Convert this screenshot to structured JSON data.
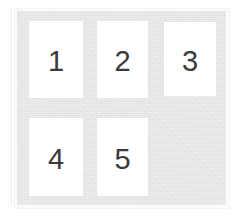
{
  "page": {
    "background_color": "#ffffff",
    "board_color": "#e4e4e4",
    "card_color": "#ffffff",
    "text_color": "#3a3a3a"
  },
  "board": {
    "name": "numbered-card-grid",
    "columns": 3,
    "rows": 2,
    "cells": [
      {
        "id": "cell-1",
        "label": "1",
        "filled": true,
        "row": 1,
        "col": 1
      },
      {
        "id": "cell-2",
        "label": "2",
        "filled": true,
        "row": 1,
        "col": 2
      },
      {
        "id": "cell-3",
        "label": "3",
        "filled": true,
        "row": 1,
        "col": 3
      },
      {
        "id": "cell-4",
        "label": "4",
        "filled": true,
        "row": 2,
        "col": 1
      },
      {
        "id": "cell-5",
        "label": "5",
        "filled": true,
        "row": 2,
        "col": 2
      },
      {
        "id": "cell-6",
        "label": "",
        "filled": false,
        "row": 2,
        "col": 3
      }
    ]
  }
}
